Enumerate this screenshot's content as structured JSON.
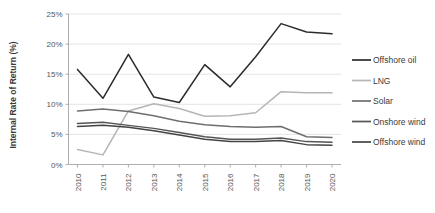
{
  "chart_data": {
    "type": "line",
    "title": "",
    "xlabel": "",
    "ylabel": "Internal Rate of Return (%)",
    "categories": [
      "2010",
      "2011",
      "2012",
      "2013",
      "2014",
      "2015",
      "2016",
      "2017",
      "2018",
      "2019",
      "2020"
    ],
    "x": [
      2010,
      2011,
      2012,
      2013,
      2014,
      2015,
      2016,
      2017,
      2018,
      2019,
      2020
    ],
    "ylim": [
      0,
      25
    ],
    "yticks": [
      0,
      5,
      10,
      15,
      20,
      25
    ],
    "ytick_labels": [
      "0%",
      "5%",
      "10%",
      "15%",
      "20%",
      "25%"
    ],
    "grid": true,
    "legend_position": "right",
    "series": [
      {
        "name": "Offshore oil",
        "color": "#2b2b2b",
        "values": [
          15.8,
          11.0,
          18.3,
          11.2,
          10.3,
          16.6,
          12.9,
          17.9,
          23.4,
          22.0,
          21.7
        ]
      },
      {
        "name": "LNG",
        "color": "#b5b5b5",
        "values": [
          2.5,
          1.6,
          8.9,
          10.1,
          9.3,
          8.0,
          8.1,
          8.6,
          12.1,
          11.9,
          11.9
        ]
      },
      {
        "name": "Solar",
        "color": "#6e6e6e",
        "values": [
          8.9,
          9.2,
          8.8,
          8.1,
          7.2,
          6.6,
          6.3,
          6.2,
          6.3,
          4.6,
          4.5
        ]
      },
      {
        "name": "Onshore wind",
        "color": "#555555",
        "values": [
          6.8,
          7.0,
          6.5,
          6.0,
          5.3,
          4.6,
          4.2,
          4.2,
          4.4,
          3.8,
          3.7
        ]
      },
      {
        "name": "Offshore wind",
        "color": "#444444",
        "values": [
          6.3,
          6.5,
          6.2,
          5.6,
          4.9,
          4.2,
          3.8,
          3.8,
          4.0,
          3.3,
          3.2
        ]
      }
    ]
  },
  "legend": {
    "items": [
      {
        "label": "Offshore oil"
      },
      {
        "label": "LNG"
      },
      {
        "label": "Solar"
      },
      {
        "label": "Onshore wind"
      },
      {
        "label": "Offshore wind"
      }
    ]
  }
}
